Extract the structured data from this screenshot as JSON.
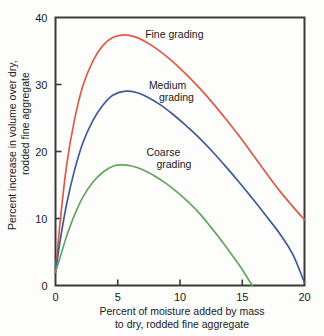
{
  "chart_data": {
    "type": "line",
    "title": "",
    "xlabel": "Percent of moisture added by mass to dry, rodded fine aggregate",
    "xlabel_line1": "Percent of moisture added by mass",
    "xlabel_line2": "to dry, rodded fine aggregate",
    "ylabel": "Percent increase in volume over dry, rodded fine aggregate",
    "ylabel_line1": "Percent increase in volume over dry,",
    "ylabel_line2": "rodded fine aggregate",
    "xlim": [
      0,
      20
    ],
    "ylim": [
      0,
      40
    ],
    "xticks": [
      0,
      5,
      10,
      15,
      20
    ],
    "yticks": [
      0,
      10,
      20,
      30,
      40
    ],
    "xtick_labels": [
      "0",
      "5",
      "10",
      "15",
      "20"
    ],
    "ytick_labels": [
      "0",
      "10",
      "20",
      "30",
      "40"
    ],
    "grid": false,
    "legend_position": "inline-annotations",
    "series": [
      {
        "name": "Fine grading",
        "color": "#de5a47",
        "label_x": 7.2,
        "label_y": 37.0,
        "label_lines": [
          "Fine grading"
        ],
        "peak": [
          5.5,
          37.4
        ],
        "x": [
          0,
          0.4,
          0.9,
          1.5,
          2.2,
          3.0,
          3.8,
          4.6,
          5.5,
          6.4,
          7.3,
          8.3,
          9.3,
          10.4,
          11.5,
          12.6,
          13.7,
          14.8,
          15.9,
          17.0,
          18.1,
          19.1,
          20.0
        ],
        "y": [
          2.0,
          10.0,
          18.0,
          24.5,
          29.8,
          33.5,
          35.8,
          37.0,
          37.4,
          37.1,
          36.3,
          35.1,
          33.6,
          31.7,
          29.6,
          27.3,
          24.8,
          22.2,
          19.4,
          16.6,
          13.9,
          11.7,
          9.8
        ]
      },
      {
        "name": "Medium grading",
        "color": "#3d5c96",
        "label_x": 7.5,
        "label_y": 29.3,
        "label_lines": [
          "Medium",
          "grading"
        ],
        "peak": [
          5.6,
          29.0
        ],
        "x": [
          0,
          0.4,
          0.9,
          1.5,
          2.2,
          3.0,
          3.8,
          4.6,
          5.6,
          6.5,
          7.4,
          8.4,
          9.4,
          10.4,
          11.5,
          12.6,
          13.7,
          14.8,
          15.9,
          17.0,
          18.1,
          19.1,
          20.0
        ],
        "y": [
          2.0,
          7.0,
          12.2,
          17.0,
          21.3,
          24.6,
          26.9,
          28.4,
          29.0,
          28.8,
          28.1,
          27.0,
          25.6,
          24.0,
          22.1,
          20.0,
          17.7,
          15.3,
          12.8,
          10.2,
          7.5,
          4.5,
          0.4
        ]
      },
      {
        "name": "Coarse grading",
        "color": "#63a463",
        "label_x": 7.3,
        "label_y": 19.4,
        "label_lines": [
          "Coarse",
          "grading"
        ],
        "peak": [
          5.3,
          18.0
        ],
        "x": [
          0,
          0.4,
          0.9,
          1.5,
          2.2,
          3.0,
          3.8,
          4.6,
          5.3,
          6.2,
          7.1,
          8.0,
          8.9,
          9.8,
          10.7,
          11.6,
          12.4,
          13.2,
          14.0,
          14.7,
          15.2,
          15.5,
          15.8
        ],
        "y": [
          2.0,
          4.4,
          7.4,
          10.4,
          13.2,
          15.4,
          16.9,
          17.8,
          18.0,
          17.8,
          17.2,
          16.3,
          15.2,
          13.9,
          12.4,
          10.7,
          8.9,
          7.0,
          5.0,
          3.2,
          1.8,
          0.9,
          0.0
        ]
      }
    ]
  }
}
